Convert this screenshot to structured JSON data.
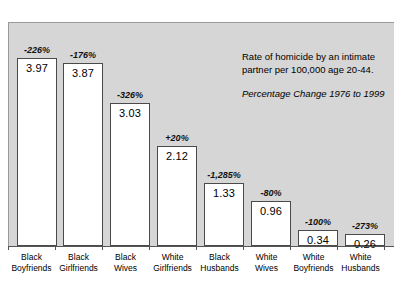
{
  "chart_data": {
    "type": "bar",
    "title": "",
    "xlabel": "",
    "ylabel": "",
    "ylim": [
      0,
      4.4
    ],
    "grid": false,
    "legend": "none",
    "categories": [
      "Black Boyfriends",
      "Black Girlfriends",
      "Black Wives",
      "White Girlfriends",
      "Black Husbands",
      "White Wives",
      "White Boyfriends",
      "White Husbands"
    ],
    "values": [
      3.97,
      3.87,
      3.03,
      2.12,
      1.33,
      0.96,
      0.34,
      0.26
    ],
    "data_labels": [
      "3.97",
      "3.87",
      "3.03",
      "2.12",
      "1.33",
      "0.96",
      "0.34",
      "0.26"
    ],
    "annotations": [
      "-226%",
      "-176%",
      "-326%",
      "+20%",
      "-1,285%",
      "-80%",
      "-100%",
      "-273%"
    ],
    "note_line_1": "Rate of homicide by an intimate",
    "note_line_2": "partner per 100,000 age 20-44.",
    "subtitle": "Percentage Change 1976 to 1999"
  },
  "categories_wrapped": [
    {
      "line1": "Black",
      "line2": "Boyfriends"
    },
    {
      "line1": "Black",
      "line2": "Girlfriends"
    },
    {
      "line1": "Black",
      "line2": "Wives"
    },
    {
      "line1": "White",
      "line2": "Girlfriends"
    },
    {
      "line1": "Black",
      "line2": "Husbands"
    },
    {
      "line1": "White",
      "line2": "Wives"
    },
    {
      "line1": "White",
      "line2": "Boyfriends"
    },
    {
      "line1": "White",
      "line2": "Husbands"
    }
  ],
  "colors": {
    "plot_background": "#d6d6d6",
    "bar_fill": "#ffffff",
    "bar_border": "#4a4a4a",
    "axis": "#555555",
    "text": "#000000",
    "page_background": "#ffffff"
  }
}
